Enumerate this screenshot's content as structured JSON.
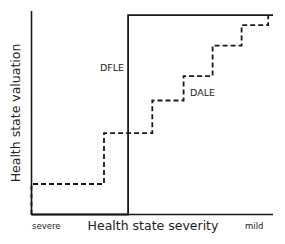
{
  "chart_data": {
    "type": "line",
    "title": "",
    "xlabel": "Health state severity",
    "ylabel": "Health state valuation",
    "x_tick_labels": {
      "left": "severe",
      "right": "mild"
    },
    "grid": false,
    "legend": "inline labels",
    "xlim": [
      0,
      1
    ],
    "ylim": [
      0,
      1
    ],
    "series": [
      {
        "name": "DFLE",
        "style": "solid",
        "color": "#1a1a1a",
        "label_pos": {
          "x": 0.36,
          "y": 0.73
        },
        "points": [
          [
            0.0,
            0.0
          ],
          [
            0.4,
            0.0
          ],
          [
            0.4,
            0.98
          ],
          [
            1.0,
            0.98
          ]
        ]
      },
      {
        "name": "DALE",
        "style": "dashed",
        "color": "#1a1a1a",
        "label_pos": {
          "x": 0.66,
          "y": 0.63
        },
        "points": [
          [
            0.0,
            0.0
          ],
          [
            0.0,
            0.15
          ],
          [
            0.3,
            0.15
          ],
          [
            0.3,
            0.4
          ],
          [
            0.5,
            0.4
          ],
          [
            0.5,
            0.56
          ],
          [
            0.63,
            0.56
          ],
          [
            0.63,
            0.68
          ],
          [
            0.75,
            0.68
          ],
          [
            0.75,
            0.83
          ],
          [
            0.87,
            0.83
          ],
          [
            0.87,
            0.93
          ],
          [
            0.98,
            0.93
          ],
          [
            0.98,
            0.98
          ]
        ]
      }
    ]
  },
  "labels": {
    "ylabel": "Health state valuation",
    "xlabel": "Health state severity",
    "severe": "severe",
    "mild": "mild",
    "dfle": "DFLE",
    "dale": "DALE"
  }
}
